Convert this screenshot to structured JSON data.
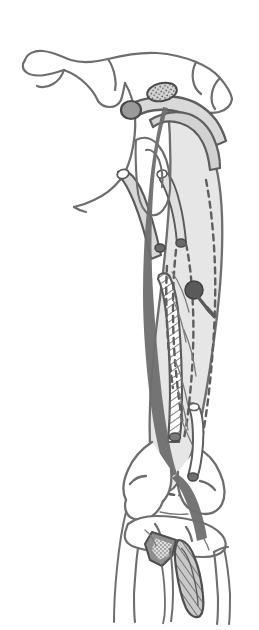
{
  "figure": {
    "title": "Anatomical line drawing of lower limb",
    "background_color": "#ffffff",
    "outline_color": "#6e6e6e",
    "bone_fill_color": "#ffffff",
    "soft_tissue_fill_color": "#e6e6e6",
    "graft_fill_color": "#dcdcdc",
    "dark_accent_color": "#555555",
    "marker_color": "#5a5a5a",
    "hatch_color": "#6e6e6e",
    "line_width_main": 2.4,
    "line_width_thin": 1.3,
    "dash_pattern": "6 5"
  },
  "structures": [
    {
      "id": "pelvis-ilium",
      "label": "Pelvis / iliac crest outline",
      "region": "top"
    },
    {
      "id": "greater-trochanter",
      "label": "Greater trochanter",
      "region": "upper"
    },
    {
      "id": "femoral-head-neck",
      "label": "Femoral head and neck",
      "region": "upper"
    },
    {
      "id": "femoral-shaft",
      "label": "Femoral shaft",
      "region": "middle"
    },
    {
      "id": "quadriceps-mass",
      "label": "Quadriceps muscle mass (shaded)",
      "region": "middle"
    },
    {
      "id": "tendon-graft-strip",
      "label": "Hatched tendon graft strip",
      "region": "middle-left"
    },
    {
      "id": "fixation-marker",
      "label": "Fixation point marker",
      "region": "middle"
    },
    {
      "id": "bone-tunnel-rod",
      "label": "Bone tunnel / guide rod",
      "region": "upper-left"
    },
    {
      "id": "distal-femur-condyles",
      "label": "Distal femoral condyles",
      "region": "lower"
    },
    {
      "id": "tibial-plateau",
      "label": "Tibial plateau",
      "region": "lower"
    },
    {
      "id": "tibial-tubercle-graft",
      "label": "Tibial tubercle with hatched bone block",
      "region": "bottom"
    },
    {
      "id": "patellar-tendon",
      "label": "Patellar tendon",
      "region": "lower"
    },
    {
      "id": "proximal-stipple",
      "label": "Stippled bone block at proximal attachment",
      "region": "upper"
    }
  ],
  "annotations": {
    "dashed_paths_count": 5,
    "markers_count": 1,
    "hatched_regions_count": 3
  }
}
